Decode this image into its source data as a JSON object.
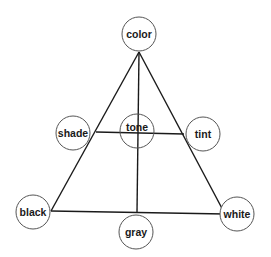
{
  "diagram": {
    "type": "color-triangle",
    "nodes": {
      "color": {
        "label": "color",
        "cx": 139,
        "cy": 34,
        "r": 17
      },
      "shade": {
        "label": "shade",
        "cx": 73,
        "cy": 133,
        "r": 17
      },
      "tone": {
        "label": "tone",
        "cx": 137,
        "cy": 131,
        "r": 17
      },
      "tint": {
        "label": "tint",
        "cx": 203,
        "cy": 134,
        "r": 17
      },
      "black": {
        "label": "black",
        "cx": 33,
        "cy": 212,
        "r": 17
      },
      "gray": {
        "label": "gray",
        "cx": 136,
        "cy": 232,
        "r": 17
      },
      "white": {
        "label": "white",
        "cx": 237,
        "cy": 214,
        "r": 17
      }
    },
    "edges": [
      {
        "from": "color",
        "to": "black"
      },
      {
        "from": "color",
        "to": "white"
      },
      {
        "from": "black",
        "to": "white"
      },
      {
        "from": "color",
        "to": "gray"
      },
      {
        "from": "shade",
        "to": "tint"
      }
    ],
    "colors": {
      "line": "#1a1a1a",
      "circle_stroke": "#555555",
      "background": "#ffffff"
    }
  }
}
